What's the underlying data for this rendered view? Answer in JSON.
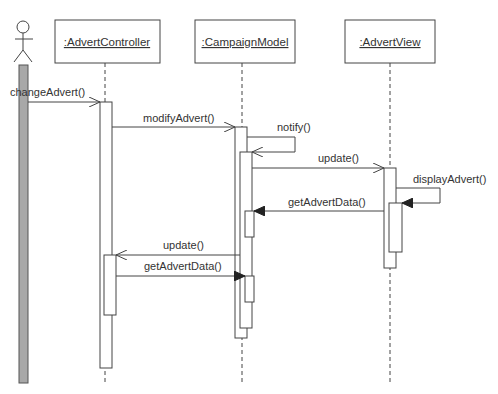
{
  "diagram": {
    "type": "UML sequence diagram",
    "actor": {
      "name": "actor-user"
    },
    "objects": [
      {
        "id": "controller",
        "label": ":AdvertController"
      },
      {
        "id": "model",
        "label": ":CampaignModel"
      },
      {
        "id": "view",
        "label": ":AdvertView"
      }
    ],
    "messages": [
      {
        "label": "changeAdvert()",
        "from": "actor",
        "to": "controller",
        "arrow": "open"
      },
      {
        "label": "modifyAdvert()",
        "from": "controller",
        "to": "model",
        "arrow": "open"
      },
      {
        "label": "notify()",
        "from": "model",
        "to": "model",
        "arrow": "open"
      },
      {
        "label": "update()",
        "from": "model",
        "to": "view",
        "arrow": "open"
      },
      {
        "label": "displayAdvert()",
        "from": "view",
        "to": "view",
        "arrow": "filled"
      },
      {
        "label": "getAdvertData()",
        "from": "view",
        "to": "model",
        "arrow": "filled"
      },
      {
        "label": "update()",
        "from": "model",
        "to": "controller",
        "arrow": "open"
      },
      {
        "label": "getAdvertData()",
        "from": "controller",
        "to": "model",
        "arrow": "filled"
      }
    ]
  },
  "colors": {
    "line": "#444444",
    "actor_bar": "#a8a8a8",
    "background": "#ffffff"
  }
}
